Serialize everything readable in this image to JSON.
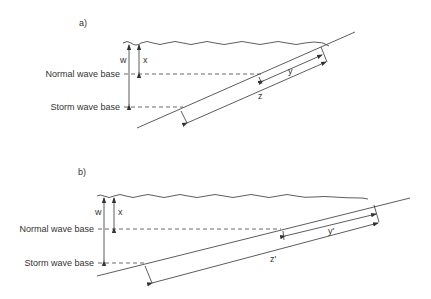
{
  "diagram": {
    "panels": [
      {
        "id": "a",
        "label": "a)",
        "levels": {
          "normal": "Normal wave base",
          "storm": "Storm wave base"
        },
        "depth_labels": {
          "storm_depth": "w",
          "normal_depth": "x"
        },
        "slope_labels": {
          "normal_span": "y",
          "storm_span": "z"
        }
      },
      {
        "id": "b",
        "label": "b)",
        "levels": {
          "normal": "Normal wave base",
          "storm": "Storm wave base"
        },
        "depth_labels": {
          "storm_depth": "w",
          "normal_depth": "x"
        },
        "slope_labels": {
          "normal_span": "y'",
          "storm_span": "z'"
        }
      }
    ],
    "colors": {
      "line": "#333333",
      "background": "#ffffff"
    }
  }
}
